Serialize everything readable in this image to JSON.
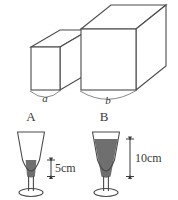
{
  "figure": {
    "stroke_color": "#4a4a4a",
    "liquid_color": "#6f6f6f",
    "background_color": "#ffffff",
    "text_color": "#3a3a3a"
  },
  "cubes": [
    {
      "id": "cube-small",
      "edge_label": "a",
      "name_label": "A",
      "relative_size": "small"
    },
    {
      "id": "cube-large",
      "edge_label": "b",
      "name_label": "B",
      "relative_size": "large"
    }
  ],
  "glasses": [
    {
      "id": "glass-a",
      "name_label": "A",
      "liquid_height_label": "5cm",
      "liquid_height_value": 5,
      "unit": "cm",
      "fill_level": "low"
    },
    {
      "id": "glass-b",
      "name_label": "B",
      "liquid_height_label": "10cm",
      "liquid_height_value": 10,
      "unit": "cm",
      "fill_level": "high"
    }
  ]
}
